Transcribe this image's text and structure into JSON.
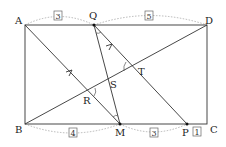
{
  "figure": {
    "type": "geometry-rectangle",
    "points": {
      "A": {
        "label": "A",
        "x": 25,
        "y": 25
      },
      "D": {
        "label": "D",
        "x": 207,
        "y": 25
      },
      "B": {
        "label": "B",
        "x": 25,
        "y": 124
      },
      "C": {
        "label": "C",
        "x": 207,
        "y": 124
      },
      "Q": {
        "label": "Q",
        "x": 94,
        "y": 25
      },
      "M": {
        "label": "M",
        "x": 120,
        "y": 124
      },
      "P": {
        "label": "P",
        "x": 187,
        "y": 124
      },
      "R": {
        "label": "R",
        "x": 89,
        "y": 91
      },
      "S": {
        "label": "S",
        "x": 108,
        "y": 80
      },
      "T": {
        "label": "T",
        "x": 132,
        "y": 67
      }
    },
    "ratios": {
      "AQ": "3",
      "QD": "5",
      "BM": "4",
      "MP": "3",
      "PC": "1"
    },
    "segments": [
      "AD",
      "BC",
      "AB",
      "DC",
      "BD",
      "AM",
      "QM",
      "QP"
    ],
    "parallel_marks": [
      "AM",
      "QP"
    ],
    "angle_marks": [
      "Q",
      "T",
      "R",
      "M"
    ]
  }
}
